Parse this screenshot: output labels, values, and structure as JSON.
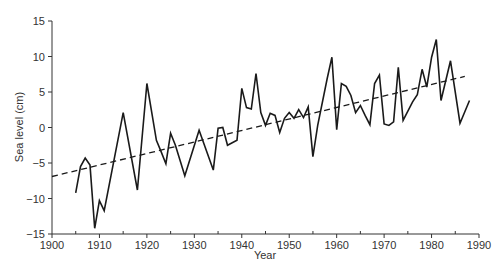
{
  "chart_data": {
    "type": "line",
    "title": "",
    "xlabel": "Year",
    "ylabel": "Sea level (cm)",
    "xlim": [
      1900,
      1990
    ],
    "ylim": [
      -15,
      15
    ],
    "x_ticks": [
      1900,
      1910,
      1920,
      1930,
      1940,
      1950,
      1960,
      1970,
      1980,
      1990
    ],
    "x_minor_ticks": [
      1905,
      1915,
      1925,
      1935,
      1945,
      1955,
      1965,
      1975,
      1985
    ],
    "y_ticks": [
      -15,
      -10,
      -5,
      0,
      5,
      10,
      15
    ],
    "grid": false,
    "legend": null,
    "series": [
      {
        "name": "Sea level",
        "style": "solid",
        "color": "#1a1a1a",
        "points": [
          [
            1905,
            -9.2
          ],
          [
            1906,
            -5.5
          ],
          [
            1907,
            -4.3
          ],
          [
            1908,
            -5.3
          ],
          [
            1909,
            -14.2
          ],
          [
            1910,
            -10.3
          ],
          [
            1911,
            -11.7
          ],
          [
            1915,
            2.1
          ],
          [
            1918,
            -8.8
          ],
          [
            1920,
            6.2
          ],
          [
            1922,
            -1.8
          ],
          [
            1923,
            -3.4
          ],
          [
            1924,
            -5.1
          ],
          [
            1925,
            -0.8
          ],
          [
            1926,
            -2.5
          ],
          [
            1928,
            -6.8
          ],
          [
            1931,
            -0.4
          ],
          [
            1934,
            -6.0
          ],
          [
            1935,
            -0.1
          ],
          [
            1936,
            0.0
          ],
          [
            1937,
            -2.5
          ],
          [
            1939,
            -1.8
          ],
          [
            1940,
            5.5
          ],
          [
            1941,
            2.8
          ],
          [
            1942,
            2.6
          ],
          [
            1943,
            7.6
          ],
          [
            1944,
            2.1
          ],
          [
            1945,
            0.3
          ],
          [
            1946,
            2.0
          ],
          [
            1947,
            1.7
          ],
          [
            1948,
            -0.7
          ],
          [
            1949,
            1.3
          ],
          [
            1950,
            2.1
          ],
          [
            1951,
            1.3
          ],
          [
            1952,
            2.5
          ],
          [
            1953,
            1.4
          ],
          [
            1954,
            2.9
          ],
          [
            1955,
            -4.1
          ],
          [
            1956,
            0.3
          ],
          [
            1958,
            6.9
          ],
          [
            1959,
            9.9
          ],
          [
            1960,
            -0.3
          ],
          [
            1961,
            6.2
          ],
          [
            1962,
            5.8
          ],
          [
            1963,
            4.5
          ],
          [
            1964,
            2.1
          ],
          [
            1965,
            3.1
          ],
          [
            1966,
            1.7
          ],
          [
            1967,
            0.4
          ],
          [
            1968,
            6.2
          ],
          [
            1969,
            7.4
          ],
          [
            1970,
            0.5
          ],
          [
            1971,
            0.3
          ],
          [
            1972,
            0.8
          ],
          [
            1973,
            8.5
          ],
          [
            1974,
            1.0
          ],
          [
            1976,
            3.6
          ],
          [
            1977,
            4.6
          ],
          [
            1978,
            8.2
          ],
          [
            1979,
            5.7
          ],
          [
            1980,
            9.9
          ],
          [
            1981,
            12.4
          ],
          [
            1982,
            3.8
          ],
          [
            1984,
            9.4
          ],
          [
            1986,
            0.6
          ],
          [
            1988,
            3.8
          ]
        ]
      },
      {
        "name": "Linear trend",
        "style": "dashed",
        "color": "#1a1a1a",
        "points": [
          [
            1900,
            -6.9
          ],
          [
            1987,
            7.2
          ]
        ]
      }
    ]
  }
}
